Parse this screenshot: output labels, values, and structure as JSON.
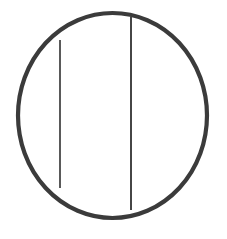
{
  "figure": {
    "canvas": {
      "width": 227,
      "height": 239,
      "background_color": "#ffffff"
    },
    "shapes": {
      "circle": {
        "name": "outer-circle",
        "center_x": 112.5,
        "center_y": 115.5,
        "radius_x": 94.5,
        "radius_y": 102.5,
        "stroke_color": "#3b3b3b",
        "stroke_width": 4.2,
        "fill": "none"
      },
      "chord_left": {
        "name": "left-vertical-chord",
        "x": 60,
        "y_top": 40,
        "y_bottom": 188,
        "stroke_color": "#3d3d3d",
        "stroke_width": 1.7
      },
      "chord_right": {
        "name": "right-vertical-chord",
        "x": 131,
        "y_top": 17,
        "y_bottom": 210,
        "stroke_color": "#3d3d3d",
        "stroke_width": 1.9
      }
    }
  }
}
